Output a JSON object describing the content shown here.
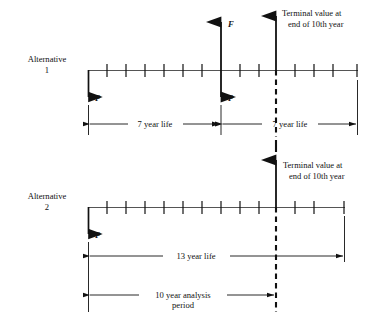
{
  "diagram": {
    "title_type": "cash-flow-diagram",
    "alternatives": [
      {
        "name_line1": "Alternative",
        "name_line2": "1",
        "timeline": {
          "start_year": 0,
          "end_year": 14,
          "tick_count": 14,
          "axis_x_start": 88,
          "axis_x_end": 358,
          "axis_y": 70
        },
        "cash_flows": [
          {
            "label": "P",
            "direction": "down",
            "year": 0
          },
          {
            "label": "F",
            "direction": "up",
            "year": 7
          },
          {
            "label": "P",
            "direction": "down",
            "year": 7
          }
        ],
        "terminal": {
          "year": 10,
          "text_line1": "Terminal value at",
          "text_line2": "end of 10th year",
          "arrow_direction": "up",
          "marker_style": "dashed"
        },
        "dimensions": [
          {
            "label": "7 year life",
            "from_year": 0,
            "to_year": 7
          },
          {
            "label": "7 year life",
            "from_year": 7,
            "to_year": 14
          }
        ]
      },
      {
        "name_line1": "Alternative",
        "name_line2": "2",
        "timeline": {
          "start_year": 0,
          "end_year": 13,
          "tick_count": 13,
          "axis_x_start": 88,
          "axis_x_end": 345,
          "axis_y": 207
        },
        "cash_flows": [
          {
            "label": "P",
            "direction": "down",
            "year": 0
          }
        ],
        "terminal": {
          "year": 10,
          "text_line1": "Terminal value at",
          "text_line2": "end of 10th year",
          "arrow_direction": "up",
          "marker_style": "dashed"
        },
        "dimensions": [
          {
            "label": "13 year life",
            "from_year": 0,
            "to_year": 13
          },
          {
            "label_line1": "10 year analysis",
            "label_line2": "period",
            "from_year": 0,
            "to_year": 10
          }
        ]
      }
    ],
    "colors": {
      "ink": "#111111",
      "axis": "#444444",
      "background": "#ffffff"
    }
  },
  "labels": {
    "alt1_name_l1": "Alternative",
    "alt1_name_l2": "1",
    "alt2_name_l1": "Alternative",
    "alt2_name_l2": "2",
    "terminal1_l1": "Terminal value at",
    "terminal1_l2": "end of 10th year",
    "terminal2_l1": "Terminal value at",
    "terminal2_l2": "end of 10th year",
    "p1": "P",
    "f1": "F",
    "p2": "P",
    "p3": "P",
    "dim_7yr_a": "7 year life",
    "dim_7yr_b": "7 year life",
    "dim_13yr": "13 year life",
    "dim_10yr_l1": "10 year analysis",
    "dim_10yr_l2": "period"
  }
}
